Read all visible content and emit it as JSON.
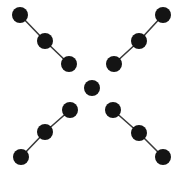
{
  "figure": {
    "title": "",
    "width": 183,
    "height": 173,
    "background_color": "#ffffff",
    "node_color": "#141414",
    "edge_color": "#3a3a3a",
    "node_radius": 8,
    "edge_width": 1.6
  },
  "graph": {
    "description": "X-shaped node-link diagram: four three-node chains radiating diagonally from a central isolated node",
    "node_count": 13,
    "edge_count": 8,
    "component_count": 5,
    "nodes": [
      {
        "id": "n1",
        "label": "",
        "x": 20,
        "y": 15,
        "group": "top-left"
      },
      {
        "id": "n2",
        "label": "",
        "x": 45,
        "y": 41,
        "group": "top-left"
      },
      {
        "id": "n3",
        "label": "",
        "x": 69,
        "y": 64,
        "group": "top-left"
      },
      {
        "id": "n4",
        "label": "",
        "x": 163,
        "y": 15,
        "group": "top-right"
      },
      {
        "id": "n5",
        "label": "",
        "x": 139,
        "y": 41,
        "group": "top-right"
      },
      {
        "id": "n6",
        "label": "",
        "x": 114,
        "y": 64,
        "group": "top-right"
      },
      {
        "id": "n7",
        "label": "",
        "x": 92,
        "y": 88,
        "group": "center"
      },
      {
        "id": "n8",
        "label": "",
        "x": 70,
        "y": 110,
        "group": "bottom-left"
      },
      {
        "id": "n9",
        "label": "",
        "x": 45,
        "y": 132,
        "group": "bottom-left"
      },
      {
        "id": "n10",
        "label": "",
        "x": 21,
        "y": 157,
        "group": "bottom-left"
      },
      {
        "id": "n11",
        "label": "",
        "x": 113,
        "y": 110,
        "group": "bottom-right"
      },
      {
        "id": "n12",
        "label": "",
        "x": 139,
        "y": 133,
        "group": "bottom-right"
      },
      {
        "id": "n13",
        "label": "",
        "x": 163,
        "y": 157,
        "group": "bottom-right"
      }
    ],
    "edges": [
      {
        "source": "n1",
        "target": "n2",
        "group": "top-left"
      },
      {
        "source": "n2",
        "target": "n3",
        "group": "top-left"
      },
      {
        "source": "n4",
        "target": "n5",
        "group": "top-right"
      },
      {
        "source": "n5",
        "target": "n6",
        "group": "top-right"
      },
      {
        "source": "n8",
        "target": "n9",
        "group": "bottom-left"
      },
      {
        "source": "n9",
        "target": "n10",
        "group": "bottom-left"
      },
      {
        "source": "n11",
        "target": "n12",
        "group": "bottom-right"
      },
      {
        "source": "n12",
        "target": "n13",
        "group": "bottom-right"
      }
    ]
  }
}
